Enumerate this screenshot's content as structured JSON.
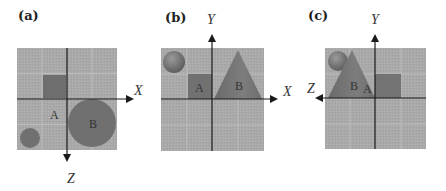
{
  "colors": {
    "grid_bg": "#a8a8a8",
    "grid_line": "#bdbdbd",
    "axis": "#1a1a1a",
    "shape_dark": "#707070",
    "shape_mid": "#7a7a7a",
    "sphere": "#7c7c7c"
  },
  "panels": [
    {
      "id": "a",
      "label": "(a)",
      "axes": {
        "horizontal": "X",
        "vertical": "Z"
      },
      "objects": [
        {
          "name": "A",
          "shape": "square"
        },
        {
          "name": "B",
          "shape": "circle"
        },
        {
          "name": "",
          "shape": "small-circle"
        }
      ]
    },
    {
      "id": "b",
      "label": "(b)",
      "axes": {
        "horizontal": "X",
        "vertical": "Y"
      },
      "objects": [
        {
          "name": "A",
          "shape": "square"
        },
        {
          "name": "B",
          "shape": "cone"
        },
        {
          "name": "",
          "shape": "sphere"
        }
      ]
    },
    {
      "id": "c",
      "label": "(c)",
      "axes": {
        "horizontal": "Z",
        "vertical": "Y"
      },
      "objects": [
        {
          "name": "A",
          "shape": "square"
        },
        {
          "name": "B",
          "shape": "cone"
        },
        {
          "name": "",
          "shape": "sphere"
        }
      ]
    }
  ]
}
